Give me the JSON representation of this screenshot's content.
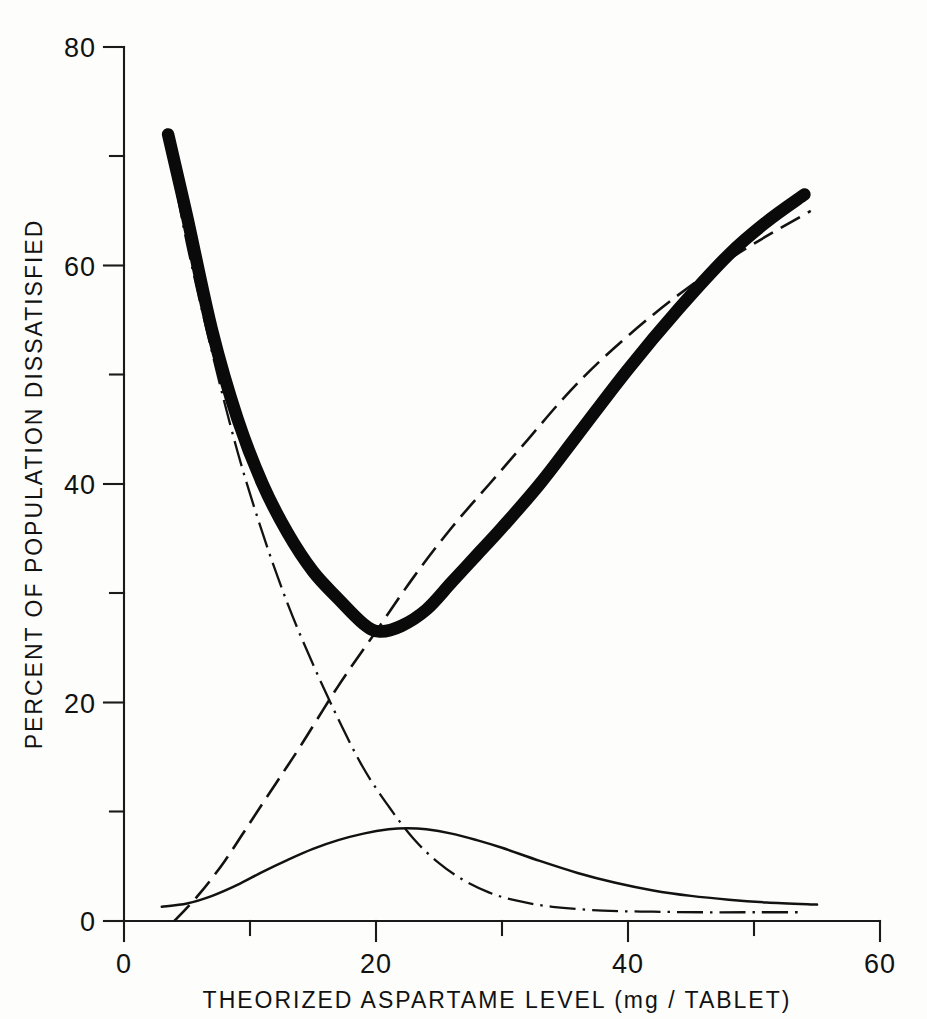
{
  "chart_data": {
    "type": "line",
    "title": "",
    "xlabel": "THEORIZED ASPARTAME LEVEL (mg / TABLET)",
    "ylabel": "PERCENT OF POPULATION DISSATISFIED",
    "xlim": [
      0,
      60
    ],
    "ylim": [
      0,
      80
    ],
    "grid": false,
    "legend": "none",
    "x_ticks": [
      0,
      20,
      40,
      60
    ],
    "x_ticks_minor": [
      10,
      30,
      50
    ],
    "y_ticks": [
      0,
      20,
      40,
      60,
      80
    ],
    "y_ticks_minor": [
      10,
      30,
      50,
      70
    ],
    "x_tick_labels": [
      "0",
      "20",
      "40",
      "60"
    ],
    "y_tick_labels": [
      "0",
      "20",
      "40",
      "60",
      "80"
    ],
    "series": [
      {
        "name": "total-dissatisfied",
        "style": "thick-solid",
        "x": [
          3.5,
          5,
          7,
          9,
          11,
          13,
          15,
          17,
          19,
          20.3,
          22,
          24,
          26,
          28,
          30,
          33,
          36,
          40,
          44,
          48,
          51,
          54
        ],
        "values": [
          72,
          64.5,
          54,
          46,
          40,
          35.5,
          32,
          29.5,
          27.2,
          26.5,
          27,
          28.5,
          31,
          33.5,
          36,
          40,
          44.5,
          50.5,
          56,
          61,
          64,
          66.5
        ]
      },
      {
        "name": "too-little-aspartame",
        "style": "dash-dot",
        "x": [
          3.6,
          5,
          7,
          9,
          11,
          13,
          15,
          17,
          19,
          21,
          23,
          25,
          27,
          29,
          31,
          34,
          38,
          42,
          46,
          50,
          54
        ],
        "values": [
          70.5,
          62,
          52,
          43,
          35.5,
          29,
          23.5,
          18.5,
          14,
          10.5,
          7.5,
          5.3,
          3.7,
          2.6,
          1.9,
          1.3,
          0.95,
          0.85,
          0.8,
          0.8,
          0.8
        ]
      },
      {
        "name": "too-much-aspartame",
        "style": "dashed",
        "x": [
          4.0,
          6,
          8,
          10,
          12,
          14,
          17,
          20,
          23,
          26,
          29,
          32,
          35,
          38,
          42,
          46,
          50,
          54.5
        ],
        "values": [
          0,
          2.5,
          5.5,
          9,
          12.5,
          16,
          21.5,
          26.5,
          31.5,
          36,
          40,
          44,
          48,
          51.5,
          55.5,
          59,
          62,
          65
        ]
      },
      {
        "name": "difference-component",
        "style": "thin-solid",
        "x": [
          3.0,
          5,
          7,
          9,
          11,
          13,
          15,
          17,
          19,
          21,
          22.5,
          24,
          26,
          28,
          30,
          33,
          36,
          39,
          42,
          45,
          48,
          51,
          55
        ],
        "values": [
          1.3,
          1.6,
          2.3,
          3.3,
          4.5,
          5.6,
          6.6,
          7.4,
          8.0,
          8.4,
          8.5,
          8.4,
          8.0,
          7.4,
          6.7,
          5.5,
          4.4,
          3.5,
          2.8,
          2.3,
          1.95,
          1.7,
          1.5
        ]
      }
    ]
  },
  "axes": {
    "x_axis_name": "x-axis",
    "y_axis_name": "y-axis"
  },
  "colors": {
    "ink": "#121212",
    "background": "#fdfdfc"
  }
}
